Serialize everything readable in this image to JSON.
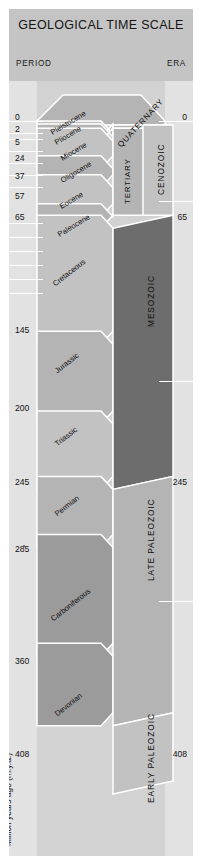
{
  "header": {
    "title": "GEOLOGICAL TIME SCALE",
    "column_period": "PERIOD",
    "column_era": "ERA"
  },
  "axis": {
    "caption": "Million years ago (m.y.a.)",
    "left_ticks": [
      "0",
      "2",
      "5",
      "24",
      "37",
      "57",
      "65",
      "145",
      "200",
      "245",
      "285",
      "360",
      "408"
    ],
    "right_ticks": [
      "0",
      "65",
      "245",
      "408"
    ]
  },
  "epochs": [
    {
      "label": "Pleistocene"
    },
    {
      "label": "Pliocene"
    },
    {
      "label": "Miocene"
    },
    {
      "label": "Oligocene"
    },
    {
      "label": "Eocene"
    },
    {
      "label": "Paleocene"
    },
    {
      "label": "Cretaceous"
    },
    {
      "label": "Jurassic"
    },
    {
      "label": "Triassic"
    },
    {
      "label": "Permian"
    },
    {
      "label": "Carboniferous"
    },
    {
      "label": "Devonian"
    }
  ],
  "periods": [
    {
      "label": "QUATERNARY"
    },
    {
      "label": "TERTIARY"
    }
  ],
  "eras": [
    {
      "label": "CENOZOIC"
    },
    {
      "label": "MESOZOIC"
    },
    {
      "label": "LATE PALEOZOIC"
    },
    {
      "label": "EARLY PALEOZOIC"
    }
  ],
  "colors": {
    "page": "#ffffff",
    "poster": "#c9c9c9",
    "title_band": "#c4c4c4",
    "chart_background": "#d2d2d2",
    "gutter": "#e2e2e2",
    "band_light": "#c2c2c2",
    "band_medium": "#b4b4b4",
    "band_dark": "#9b9b9b",
    "band_darkest": "#6d6d6d",
    "rule": "#ffffff",
    "text": "#101010"
  },
  "chart_data": {
    "type": "table",
    "title": "GEOLOGICAL TIME SCALE",
    "ylabel": "Million years ago (m.y.a.)",
    "ylim": [
      0,
      455
    ],
    "columns": [
      "Epoch",
      "Period",
      "Era",
      "Start (Ma)",
      "End (Ma)"
    ],
    "rows": [
      [
        "Pleistocene",
        "QUATERNARY",
        "CENOZOIC",
        2,
        0
      ],
      [
        "Pliocene",
        "QUATERNARY",
        "CENOZOIC",
        5,
        2
      ],
      [
        "Miocene",
        "TERTIARY",
        "CENOZOIC",
        24,
        5
      ],
      [
        "Oligocene",
        "TERTIARY",
        "CENOZOIC",
        37,
        24
      ],
      [
        "Eocene",
        "TERTIARY",
        "CENOZOIC",
        57,
        37
      ],
      [
        "Paleocene",
        "TERTIARY",
        "CENOZOIC",
        65,
        57
      ],
      [
        "Cretaceous",
        "",
        "MESOZOIC",
        145,
        65
      ],
      [
        "Jurassic",
        "",
        "MESOZOIC",
        200,
        145
      ],
      [
        "Triassic",
        "",
        "MESOZOIC",
        245,
        200
      ],
      [
        "Permian",
        "",
        "LATE PALEOZOIC",
        285,
        245
      ],
      [
        "Carboniferous",
        "",
        "LATE PALEOZOIC",
        360,
        285
      ],
      [
        "Devonian",
        "",
        "LATE PALEOZOIC",
        408,
        360
      ],
      [
        "",
        "",
        "EARLY PALEOZOIC",
        455,
        408
      ]
    ],
    "boundaries_left": [
      0,
      2,
      5,
      24,
      37,
      57,
      65,
      145,
      200,
      245,
      285,
      360,
      408
    ],
    "boundaries_right": [
      0,
      65,
      245,
      408
    ]
  }
}
